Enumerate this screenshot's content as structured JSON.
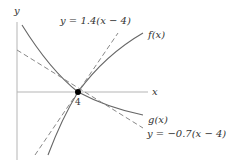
{
  "figure": {
    "axis_labels": {
      "x": "x",
      "y": "y"
    },
    "point": {
      "label": "4",
      "x_value": 4
    },
    "curves": [
      {
        "name": "f(x)",
        "label": "f(x)",
        "style": "solid"
      },
      {
        "name": "g(x)",
        "label": "g(x)",
        "style": "solid"
      }
    ],
    "tangents": [
      {
        "label": "y = 1.4(x − 4)",
        "slope": 1.4,
        "style": "dashed"
      },
      {
        "label": "y = −0.7(x − 4)",
        "slope": -0.7,
        "style": "dashed"
      }
    ],
    "colors": {
      "curve": "#555555",
      "axis": "#aaaaaa",
      "dashed": "#777777",
      "point": "#000000",
      "text": "#333333"
    }
  }
}
